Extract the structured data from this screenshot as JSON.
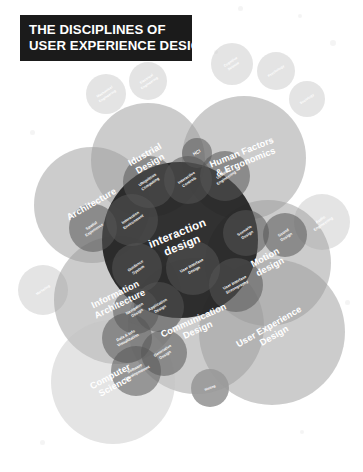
{
  "title": {
    "line1": "THE DISCIPLINES OF",
    "line2": "USER EXPERIENCE DESIGN"
  },
  "colors": {
    "background": "#ffffff",
    "title_plaque": "#1b1b1b",
    "core_dark": "#1f1f1f",
    "mid_gray": "#565656",
    "light_gray": "#9a9a9a",
    "pale_gray": "#c3c3c3",
    "label_text": "#ffffff"
  },
  "chart_data": {
    "type": "venn",
    "title": "THE DISCIPLINES OF USER EXPERIENCE DESIGN",
    "layers": [
      {
        "name": "outer-satellites",
        "tone": "pale_gray",
        "items": [
          "Mechanical Engineering",
          "Electrical Engineering",
          "Cognitive Science",
          "Psychology",
          "Sociology",
          "Marketing",
          "Audio Engineering",
          "Writing"
        ]
      },
      {
        "name": "major-disciplines",
        "tone": "light_gray",
        "items": [
          "Idustrial Design",
          "Human Factors & Ergonomics",
          "Architecture",
          "Motion design",
          "Information Architecture",
          "Communication Design",
          "Computer Science",
          "User Experience Design"
        ]
      },
      {
        "name": "core",
        "tone": "core_dark",
        "items": [
          "Interaction design"
        ]
      },
      {
        "name": "core-subfields",
        "tone": "mid_gray",
        "items": [
          "HCI",
          "Ubiquitous Computing",
          "Interactive Controls",
          "Usability Engineering",
          "Interaction Environment",
          "Guidance System",
          "User Interface Design",
          "User Interface Scenography",
          "Scenario Design",
          "Sound Design",
          "Application Design",
          "Navigation Design",
          "Data & Info Visualization",
          "Generative Design",
          "Software Development",
          "Spatial Experience"
        ]
      }
    ],
    "nodes": [
      {
        "id": "mechanical-engineering",
        "label": "Mechanical Engineering",
        "cx": 106,
        "cy": 94,
        "r": 20,
        "tone": "pale_gray",
        "size": "lab-xxs",
        "rot": -34,
        "lines": [
          "Mechanical",
          "Engineering"
        ]
      },
      {
        "id": "electrical-engineering",
        "label": "Electrical Engineering",
        "cx": 148,
        "cy": 81,
        "r": 19,
        "tone": "pale_gray",
        "size": "lab-xxs",
        "rot": -34,
        "lines": [
          "Electrical",
          "Engineering"
        ]
      },
      {
        "id": "cognitive-science",
        "label": "Cognitive Science",
        "cx": 232,
        "cy": 64,
        "r": 21,
        "tone": "pale_gray",
        "size": "lab-xxs",
        "rot": -34,
        "lines": [
          "Cognitive",
          "Science"
        ]
      },
      {
        "id": "psychology",
        "label": "Psychology",
        "cx": 276,
        "cy": 71,
        "r": 19,
        "tone": "pale_gray",
        "size": "lab-xxs",
        "rot": -34,
        "lines": [
          "Psychology"
        ]
      },
      {
        "id": "sociology",
        "label": "Sociology",
        "cx": 307,
        "cy": 99,
        "r": 18,
        "tone": "pale_gray",
        "size": "lab-xxs",
        "rot": -34,
        "lines": [
          "Sociology"
        ]
      },
      {
        "id": "marketing",
        "label": "Marketing",
        "cx": 43,
        "cy": 290,
        "r": 25,
        "tone": "pale_gray",
        "size": "lab-xxs",
        "rot": -34,
        "lines": [
          "Marketing"
        ]
      },
      {
        "id": "audio-engineering",
        "label": "Audio Engineering",
        "cx": 322,
        "cy": 222,
        "r": 28,
        "tone": "pale_gray",
        "size": "lab-xs",
        "rot": -34,
        "lines": [
          "Audio",
          "Engineering"
        ]
      },
      {
        "id": "writing",
        "label": "Writing",
        "cx": 210,
        "cy": 388,
        "r": 19,
        "tone": "mid_gray",
        "size": "lab-xxs",
        "rot": -22,
        "lines": [
          "Writing"
        ]
      },
      {
        "id": "idustrial-design",
        "label": "Idustrial Design",
        "cx": 148,
        "cy": 160,
        "r": 57,
        "tone": "light_gray",
        "size": "lab-lg",
        "rot": -30,
        "lines": [
          "Idustrial",
          "Design"
        ]
      },
      {
        "id": "human-factors-ergonomics",
        "label": "Human Factors & Ergonomics",
        "cx": 244,
        "cy": 158,
        "r": 62,
        "tone": "light_gray",
        "size": "lab-lg",
        "rot": -22,
        "lines": [
          "Human Factors",
          "& Ergonomics"
        ]
      },
      {
        "id": "architecture",
        "label": "Architecture",
        "cx": 92,
        "cy": 205,
        "r": 58,
        "tone": "light_gray",
        "size": "lab-lg",
        "rot": -30,
        "lines": [
          "Architecture"
        ]
      },
      {
        "id": "motion-design",
        "label": "Motion design",
        "cx": 268,
        "cy": 263,
        "r": 63,
        "tone": "light_gray",
        "size": "lab-lg",
        "rot": -28,
        "lines": [
          "Motion",
          "design"
        ]
      },
      {
        "id": "information-architecture",
        "label": "Information Architecture",
        "cx": 118,
        "cy": 300,
        "r": 64,
        "tone": "light_gray",
        "size": "lab-lg",
        "rot": -26,
        "lines": [
          "Information",
          "Architecture"
        ]
      },
      {
        "id": "communication-design",
        "label": "Communication Design",
        "cx": 196,
        "cy": 326,
        "r": 68,
        "tone": "light_gray",
        "size": "lab-lg",
        "rot": -24,
        "lines": [
          "Communication",
          "Design"
        ]
      },
      {
        "id": "computer-science",
        "label": "Computer Science",
        "cx": 113,
        "cy": 382,
        "r": 62,
        "tone": "pale_gray",
        "size": "lab-lg",
        "rot": -28,
        "lines": [
          "Computer",
          "Science"
        ]
      },
      {
        "id": "user-experience-design",
        "label": "User Experience Design",
        "cx": 272,
        "cy": 332,
        "r": 73,
        "tone": "light_gray",
        "size": "lab-lg",
        "rot": -30,
        "lines": [
          "User Experience",
          "Design"
        ]
      },
      {
        "id": "interaction-design-core",
        "label": "Interaction design",
        "cx": 180,
        "cy": 240,
        "r": 78,
        "tone": "core_dark",
        "size": "lab-xl",
        "rot": -22,
        "lines": [
          "interaction",
          "design"
        ]
      },
      {
        "id": "hci",
        "label": "HCI",
        "cx": 197,
        "cy": 153,
        "r": 15,
        "tone": "mid_gray",
        "size": "lab-sm",
        "rot": -30,
        "lines": [
          "HCI"
        ]
      },
      {
        "id": "ubiquitous-computing",
        "label": "Ubiquitous Computing",
        "cx": 149,
        "cy": 182,
        "r": 26,
        "tone": "mid_gray",
        "size": "lab-xs",
        "rot": -34,
        "lines": [
          "Ubiquitous",
          "Computing"
        ]
      },
      {
        "id": "interactive-controls",
        "label": "Interactive Controls",
        "cx": 188,
        "cy": 180,
        "r": 24,
        "tone": "mid_gray",
        "size": "lab-xs",
        "rot": -34,
        "lines": [
          "Interactive",
          "Controls"
        ]
      },
      {
        "id": "usability-engineering",
        "label": "Usability Engineering",
        "cx": 225,
        "cy": 176,
        "r": 25,
        "tone": "mid_gray",
        "size": "lab-xs",
        "rot": -34,
        "lines": [
          "Usability",
          "Engineering"
        ]
      },
      {
        "id": "interaction-environment",
        "label": "Interaction Environment",
        "cx": 132,
        "cy": 220,
        "r": 26,
        "tone": "mid_gray",
        "size": "lab-xs",
        "rot": -34,
        "lines": [
          "Interaction",
          "Environment"
        ]
      },
      {
        "id": "guidance-system",
        "label": "Guidance System",
        "cx": 137,
        "cy": 268,
        "r": 25,
        "tone": "mid_gray",
        "size": "lab-xs",
        "rot": -34,
        "lines": [
          "Guidance",
          "System"
        ]
      },
      {
        "id": "user-interface-design",
        "label": "User Interface Design",
        "cx": 193,
        "cy": 268,
        "r": 27,
        "tone": "mid_gray",
        "size": "lab-xs",
        "rot": -28,
        "lines": [
          "User Interface",
          "Design"
        ]
      },
      {
        "id": "user-interface-scenography",
        "label": "User Interface Scenography",
        "cx": 236,
        "cy": 285,
        "r": 27,
        "tone": "mid_gray",
        "size": "lab-xs",
        "rot": -28,
        "lines": [
          "User Interface",
          "Scenography"
        ]
      },
      {
        "id": "scenario-design",
        "label": "Scenario Design",
        "cx": 246,
        "cy": 233,
        "r": 23,
        "tone": "mid_gray",
        "size": "lab-xs",
        "rot": -34,
        "lines": [
          "Scenario",
          "Design"
        ]
      },
      {
        "id": "sound-design",
        "label": "Sound Design",
        "cx": 285,
        "cy": 235,
        "r": 22,
        "tone": "mid_gray",
        "size": "lab-xs",
        "rot": -34,
        "lines": [
          "Sound",
          "Design"
        ]
      },
      {
        "id": "application-design",
        "label": "Application Design",
        "cx": 159,
        "cy": 307,
        "r": 25,
        "tone": "mid_gray",
        "size": "lab-xs",
        "rot": -30,
        "lines": [
          "Application",
          "Design"
        ]
      },
      {
        "id": "navigation-design",
        "label": "Navigation Design",
        "cx": 136,
        "cy": 311,
        "r": 23,
        "tone": "mid_gray",
        "size": "lab-xs",
        "rot": -32,
        "lines": [
          "Navigation",
          "Design"
        ]
      },
      {
        "id": "data-info-visualization",
        "label": "Data & Info Visualization",
        "cx": 127,
        "cy": 338,
        "r": 25,
        "tone": "mid_gray",
        "size": "lab-xs",
        "rot": -28,
        "lines": [
          "Data & Info",
          "Visualization"
        ]
      },
      {
        "id": "generative-design",
        "label": "Generative Design",
        "cx": 164,
        "cy": 353,
        "r": 23,
        "tone": "mid_gray",
        "size": "lab-xs",
        "rot": -32,
        "lines": [
          "Generative",
          "Design"
        ]
      },
      {
        "id": "software-development",
        "label": "Software Development",
        "cx": 136,
        "cy": 371,
        "r": 25,
        "tone": "mid_gray",
        "size": "lab-xs",
        "rot": -28,
        "lines": [
          "Software",
          "Developmemnt"
        ]
      },
      {
        "id": "spatial-experience",
        "label": "Spatial Experience",
        "cx": 93,
        "cy": 228,
        "r": 24,
        "tone": "mid_gray",
        "size": "lab-xs",
        "rot": -34,
        "lines": [
          "Spatial",
          "Experience"
        ]
      }
    ]
  }
}
